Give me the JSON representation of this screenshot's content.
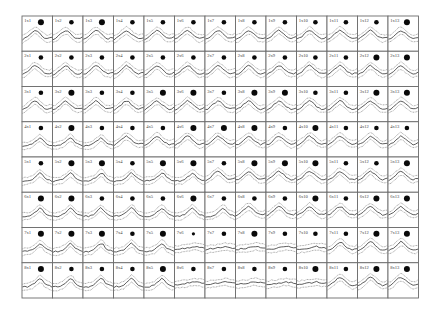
{
  "chart_data": {
    "type": "grid-of-waveforms",
    "title": "",
    "layout": {
      "rows": 8,
      "cols": 13,
      "grid_origin_px": [
        22,
        16
      ],
      "cell_width_px": 30.5,
      "cell_height_px": 35.25,
      "grid_lines": true
    },
    "cell_elements": {
      "label": "row x col identifier in top-left corner",
      "dot": "filled black circle, size varies per cell (S/M/L)",
      "waveform": "solid mean trace flanked by dotted upper and lower bands"
    },
    "labels": [
      [
        "1x1",
        "1x2",
        "1x3",
        "1x4",
        "1x5",
        "1x6",
        "1x7",
        "1x8",
        "1x9",
        "1x10",
        "1x11",
        "1x12",
        "1x13"
      ],
      [
        "2x1",
        "2x2",
        "2x3",
        "2x4",
        "2x5",
        "2x6",
        "2x7",
        "2x8",
        "2x9",
        "2x10",
        "2x11",
        "2x12",
        "2x13"
      ],
      [
        "3x1",
        "3x2",
        "3x3",
        "3x4",
        "3x5",
        "3x6",
        "3x7",
        "3x8",
        "3x9",
        "3x10",
        "3x11",
        "3x12",
        "3x13"
      ],
      [
        "4x1",
        "4x2",
        "4x3",
        "4x4",
        "4x5",
        "4x6",
        "4x7",
        "4x8",
        "4x9",
        "4x10",
        "4x11",
        "4x12",
        "4x13"
      ],
      [
        "5x1",
        "5x2",
        "5x3",
        "5x4",
        "5x5",
        "5x6",
        "5x7",
        "5x8",
        "5x9",
        "5x10",
        "5x11",
        "5x12",
        "5x13"
      ],
      [
        "6x1",
        "6x2",
        "6x3",
        "6x4",
        "6x5",
        "6x6",
        "6x7",
        "6x8",
        "6x9",
        "6x10",
        "6x11",
        "6x12",
        "6x13"
      ],
      [
        "7x1",
        "7x2",
        "7x3",
        "7x4",
        "7x5",
        "7x6",
        "7x7",
        "7x8",
        "7x9",
        "7x10",
        "7x11",
        "7x12",
        "7x13"
      ],
      [
        "8x1",
        "8x2",
        "8x3",
        "8x4",
        "8x5",
        "8x6",
        "8x7",
        "8x8",
        "8x9",
        "8x10",
        "8x11",
        "8x12",
        "8x13"
      ]
    ],
    "dot_size": [
      [
        "L",
        "M",
        "L",
        "M",
        "M",
        "M",
        "M",
        "M",
        "M",
        "M",
        "M",
        "M",
        "L"
      ],
      [
        "M",
        "M",
        "M",
        "M",
        "M",
        "M",
        "M",
        "M",
        "M",
        "M",
        "M",
        "L",
        "L"
      ],
      [
        "M",
        "L",
        "M",
        "M",
        "L",
        "L",
        "M",
        "L",
        "L",
        "M",
        "M",
        "L",
        "L"
      ],
      [
        "M",
        "L",
        "M",
        "M",
        "M",
        "L",
        "L",
        "L",
        "M",
        "L",
        "M",
        "M",
        "M"
      ],
      [
        "M",
        "L",
        "L",
        "M",
        "L",
        "L",
        "M",
        "L",
        "L",
        "L",
        "M",
        "M",
        "L"
      ],
      [
        "L",
        "L",
        "M",
        "M",
        "M",
        "L",
        "M",
        "M",
        "M",
        "L",
        "M",
        "L",
        "L"
      ],
      [
        "L",
        "L",
        "L",
        "M",
        "L",
        "S",
        "M",
        "L",
        "M",
        "M",
        "M",
        "L",
        "L"
      ],
      [
        "L",
        "M",
        "M",
        "M",
        "L",
        "M",
        "M",
        "M",
        "M",
        "L",
        "M",
        "L",
        "L"
      ]
    ],
    "dot_radius_px": {
      "S": 1.6,
      "M": 2.3,
      "L": 3.0
    },
    "waveform_profiles": {
      "symmetric": [
        0.55,
        0.5,
        0.42,
        0.32,
        0.22,
        0.15,
        0.2,
        0.3,
        0.4,
        0.48,
        0.52,
        0.5,
        0.46
      ],
      "late_peak": [
        0.6,
        0.58,
        0.58,
        0.55,
        0.5,
        0.42,
        0.32,
        0.22,
        0.28,
        0.42,
        0.5,
        0.55,
        0.58
      ],
      "flat": [
        0.5,
        0.48,
        0.46,
        0.45,
        0.44,
        0.42,
        0.4,
        0.38,
        0.36,
        0.38,
        0.4,
        0.42,
        0.43
      ]
    },
    "waveform_profile_by_row": [
      [
        "symmetric",
        "symmetric",
        "symmetric",
        "symmetric",
        "symmetric",
        "symmetric",
        "symmetric",
        "symmetric",
        "symmetric",
        "symmetric",
        "symmetric",
        "symmetric",
        "symmetric"
      ],
      [
        "symmetric",
        "symmetric",
        "symmetric",
        "symmetric",
        "symmetric",
        "symmetric",
        "symmetric",
        "symmetric",
        "symmetric",
        "symmetric",
        "symmetric",
        "symmetric",
        "symmetric"
      ],
      [
        "symmetric",
        "symmetric",
        "symmetric",
        "symmetric",
        "symmetric",
        "symmetric",
        "symmetric",
        "symmetric",
        "symmetric",
        "symmetric",
        "symmetric",
        "symmetric",
        "symmetric"
      ],
      [
        "late_peak",
        "late_peak",
        "late_peak",
        "symmetric",
        "symmetric",
        "symmetric",
        "symmetric",
        "symmetric",
        "symmetric",
        "symmetric",
        "symmetric",
        "symmetric",
        "symmetric"
      ],
      [
        "late_peak",
        "late_peak",
        "late_peak",
        "late_peak",
        "late_peak",
        "late_peak",
        "symmetric",
        "symmetric",
        "symmetric",
        "symmetric",
        "symmetric",
        "symmetric",
        "symmetric"
      ],
      [
        "late_peak",
        "late_peak",
        "late_peak",
        "late_peak",
        "late_peak",
        "late_peak",
        "late_peak",
        "symmetric",
        "symmetric",
        "symmetric",
        "symmetric",
        "symmetric",
        "symmetric"
      ],
      [
        "late_peak",
        "late_peak",
        "late_peak",
        "late_peak",
        "late_peak",
        "flat",
        "flat",
        "flat",
        "flat",
        "flat",
        "symmetric",
        "symmetric",
        "symmetric"
      ],
      [
        "late_peak",
        "late_peak",
        "late_peak",
        "late_peak",
        "late_peak",
        "flat",
        "flat",
        "flat",
        "flat",
        "flat",
        "symmetric",
        "symmetric",
        "symmetric"
      ]
    ],
    "band_offset_fraction": 0.16,
    "xlabel": "",
    "ylabel": "",
    "legend": null
  }
}
